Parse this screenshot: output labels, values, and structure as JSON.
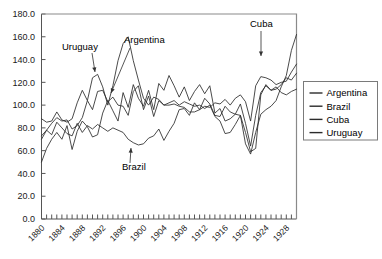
{
  "chart_data": {
    "type": "line",
    "title": "",
    "xlabel": "",
    "ylabel": "",
    "xlim": [
      1880,
      1930
    ],
    "ylim": [
      0.0,
      180.0
    ],
    "grid": false,
    "legend_position": "right",
    "ytick_labels": [
      "180.0",
      "160.0",
      "140.0",
      "120.0",
      "100.0",
      "80.0",
      "60.0",
      "40.0",
      "20.0",
      "0.0"
    ],
    "ytick_values": [
      180,
      160,
      140,
      120,
      100,
      80,
      60,
      40,
      20,
      0
    ],
    "xtick_labels": [
      "1880",
      "1884",
      "1888",
      "1892",
      "1896",
      "1900",
      "1904",
      "1908",
      "1912",
      "1916",
      "1920",
      "1924",
      "1928"
    ],
    "xtick_values": [
      1880,
      1884,
      1888,
      1892,
      1896,
      1900,
      1904,
      1908,
      1912,
      1916,
      1920,
      1924,
      1928
    ],
    "xtick_minor_step": 1,
    "x": [
      1880,
      1881,
      1882,
      1883,
      1884,
      1885,
      1886,
      1887,
      1888,
      1889,
      1890,
      1891,
      1892,
      1893,
      1894,
      1895,
      1896,
      1897,
      1898,
      1899,
      1900,
      1901,
      1902,
      1903,
      1904,
      1905,
      1906,
      1907,
      1908,
      1909,
      1910,
      1911,
      1912,
      1913,
      1914,
      1915,
      1916,
      1917,
      1918,
      1919,
      1920,
      1921,
      1922,
      1923,
      1924,
      1925,
      1926,
      1927,
      1928,
      1929,
      1930
    ],
    "series": [
      {
        "name": "Argentina",
        "values": [
          50,
          62,
          70,
          76,
          70,
          82,
          61,
          77,
          86,
          81,
          72,
          74,
          93,
          104,
          95,
          86,
          111,
          98,
          118,
          106,
          99,
          113,
          96,
          119,
          113,
          126,
          117,
          107,
          116,
          104,
          112,
          118,
          110,
          117,
          93,
          97,
          86,
          88,
          92,
          101,
          84,
          64,
          91,
          111,
          117,
          113,
          114,
          118,
          124,
          122,
          128
        ]
      },
      {
        "name": "Brazil",
        "values": [
          70,
          78,
          74,
          85,
          80,
          75,
          73,
          84,
          76,
          82,
          79,
          83,
          80,
          77,
          80,
          78,
          76,
          70,
          67,
          65,
          66,
          71,
          73,
          79,
          69,
          77,
          84,
          96,
          97,
          91,
          102,
          96,
          106,
          101,
          91,
          90,
          99,
          94,
          92,
          91,
          76,
          59,
          62,
          109,
          118,
          113,
          116,
          111,
          109,
          112,
          114
        ]
      },
      {
        "name": "Cuba",
        "values": [
          88,
          85,
          86,
          94,
          87,
          85,
          88,
          102,
          113,
          104,
          96,
          112,
          113,
          103,
          107,
          100,
          99,
          91,
          112,
          117,
          96,
          108,
          90,
          104,
          100,
          100,
          101,
          99,
          98,
          94,
          94,
          96,
          99,
          98,
          102,
          101,
          105,
          100,
          106,
          109,
          103,
          86,
          117,
          125,
          124,
          122,
          118,
          120,
          121,
          129,
          136
        ]
      },
      {
        "name": "Uruguay",
        "values": [
          73,
          78,
          84,
          89,
          86,
          87,
          79,
          82,
          89,
          104,
          124,
          127,
          116,
          100,
          117,
          139,
          154,
          160,
          139,
          122,
          106,
          100,
          107,
          105,
          100,
          102,
          104,
          100,
          103,
          101,
          99,
          100,
          97,
          100,
          90,
          86,
          75,
          76,
          83,
          91,
          66,
          57,
          76,
          92,
          96,
          99,
          104,
          116,
          126,
          148,
          162
        ]
      }
    ],
    "annotations": [
      {
        "label": "Uruguay",
        "text_x": 62,
        "text_y": 50,
        "arrow_from_x": 92,
        "arrow_from_y": 53,
        "arrow_to_x": 95,
        "arrow_to_y": 72
      },
      {
        "label": "Argentina",
        "text_x": 124,
        "text_y": 43,
        "arrow_from_x": 130,
        "arrow_from_y": 48,
        "arrow_to_x": 111,
        "arrow_to_y": 93
      },
      {
        "label": "Brazil",
        "text_x": 122,
        "text_y": 170,
        "arrow_from_x": 130,
        "arrow_from_y": 163,
        "arrow_to_x": 131,
        "arrow_to_y": 148
      },
      {
        "label": "Cuba",
        "text_x": 250,
        "text_y": 27,
        "arrow_from_x": 261,
        "arrow_from_y": 31,
        "arrow_to_x": 261,
        "arrow_to_y": 56
      }
    ],
    "legend_entries": [
      "Argentina",
      "Brazil",
      "Cuba",
      "Uruguay"
    ],
    "series_color": "#2b2b2b"
  },
  "legend": {
    "items": [
      {
        "label": "Argentina"
      },
      {
        "label": "Brazil"
      },
      {
        "label": "Cuba"
      },
      {
        "label": "Uruguay"
      }
    ]
  }
}
